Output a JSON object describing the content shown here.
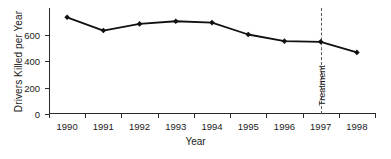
{
  "chart_data": {
    "type": "line",
    "title": "",
    "xlabel": "Year",
    "ylabel": "Drivers Killed per Year",
    "categories": [
      "1990",
      "1991",
      "1992",
      "1993",
      "1994",
      "1995",
      "1996",
      "1997",
      "1998"
    ],
    "values": [
      730,
      630,
      680,
      700,
      690,
      600,
      550,
      545,
      465
    ],
    "series": [
      {
        "name": "Drivers Killed per Year",
        "values": [
          730,
          630,
          680,
          700,
          690,
          600,
          550,
          545,
          465
        ]
      }
    ],
    "ylim": [
      0,
      800
    ],
    "yticks": [
      0,
      200,
      400,
      600
    ],
    "yticklabels": [
      "0",
      "200",
      "400",
      "600"
    ],
    "xticklabels": [
      "1990",
      "1991",
      "1992",
      "1993",
      "1994",
      "1995",
      "1996",
      "1997",
      "1998"
    ],
    "grid": false,
    "legend": "none",
    "marker": "diamond",
    "line_color": "#111111",
    "marker_color": "#111111",
    "annotations": [
      {
        "label": "Treatment",
        "type": "vertical-dashed-line",
        "x": "1997",
        "orientation": "rotated-vertical",
        "color": "#5a5a5a"
      }
    ]
  },
  "axes": {
    "y_title": "Drivers Killed per Year",
    "x_title": "Year"
  }
}
